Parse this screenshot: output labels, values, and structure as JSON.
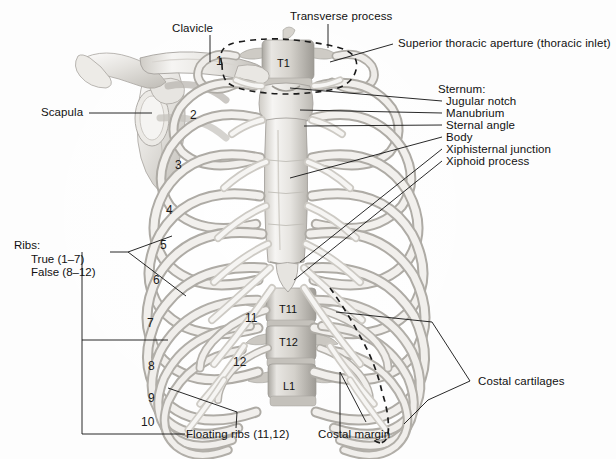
{
  "figure": {
    "background_color": "#fdfdfd",
    "ink_color": "#111111",
    "bone_light": "#f2f1ef",
    "bone_mid": "#d8d6d2",
    "bone_shadow": "#b6b3ae",
    "width": 616,
    "height": 459
  },
  "labels": {
    "clavicle": "Clavicle",
    "scapula": "Scapula",
    "transverse_process": "Transverse process",
    "superior_thoracic_aperture": "Superior thoracic aperture (thoracic inlet)",
    "sternum_heading": "Sternum:",
    "jugular_notch": "Jugular notch",
    "manubrium": "Manubrium",
    "sternal_angle": "Sternal angle",
    "body": "Body",
    "xiphisternal_junction": "Xiphisternal junction",
    "xiphoid_process": "Xiphoid process",
    "ribs_heading": "Ribs:",
    "ribs_true": "True (1–7)",
    "ribs_false": "False (8–12)",
    "floating_ribs": "Floating ribs (11,12)",
    "costal_cartilages": "Costal cartilages",
    "costal_margin": "Costal margin"
  },
  "rib_numbers": [
    {
      "id": "rib-1",
      "text": "1",
      "x": 216,
      "y": 54
    },
    {
      "id": "rib-2",
      "text": "2",
      "x": 190,
      "y": 108
    },
    {
      "id": "rib-3",
      "text": "3",
      "x": 175,
      "y": 158
    },
    {
      "id": "rib-4",
      "text": "4",
      "x": 166,
      "y": 203
    },
    {
      "id": "rib-5",
      "text": "5",
      "x": 160,
      "y": 238
    },
    {
      "id": "rib-6",
      "text": "6",
      "x": 153,
      "y": 273
    },
    {
      "id": "rib-7",
      "text": "7",
      "x": 147,
      "y": 316
    },
    {
      "id": "rib-8",
      "text": "8",
      "x": 148,
      "y": 359
    },
    {
      "id": "rib-9",
      "text": "9",
      "x": 148,
      "y": 391
    },
    {
      "id": "rib-10",
      "text": "10",
      "x": 141,
      "y": 415
    },
    {
      "id": "rib-11",
      "text": "11",
      "x": 245,
      "y": 311
    },
    {
      "id": "rib-12",
      "text": "12",
      "x": 233,
      "y": 355
    }
  ],
  "vertebra_labels": [
    {
      "id": "vertebra-t1",
      "text": "T1",
      "x": 277,
      "y": 57
    },
    {
      "id": "vertebra-t11",
      "text": "T11",
      "x": 279,
      "y": 303
    },
    {
      "id": "vertebra-t12",
      "text": "T12",
      "x": 279,
      "y": 336
    },
    {
      "id": "vertebra-l1",
      "text": "L1",
      "x": 283,
      "y": 380
    }
  ]
}
